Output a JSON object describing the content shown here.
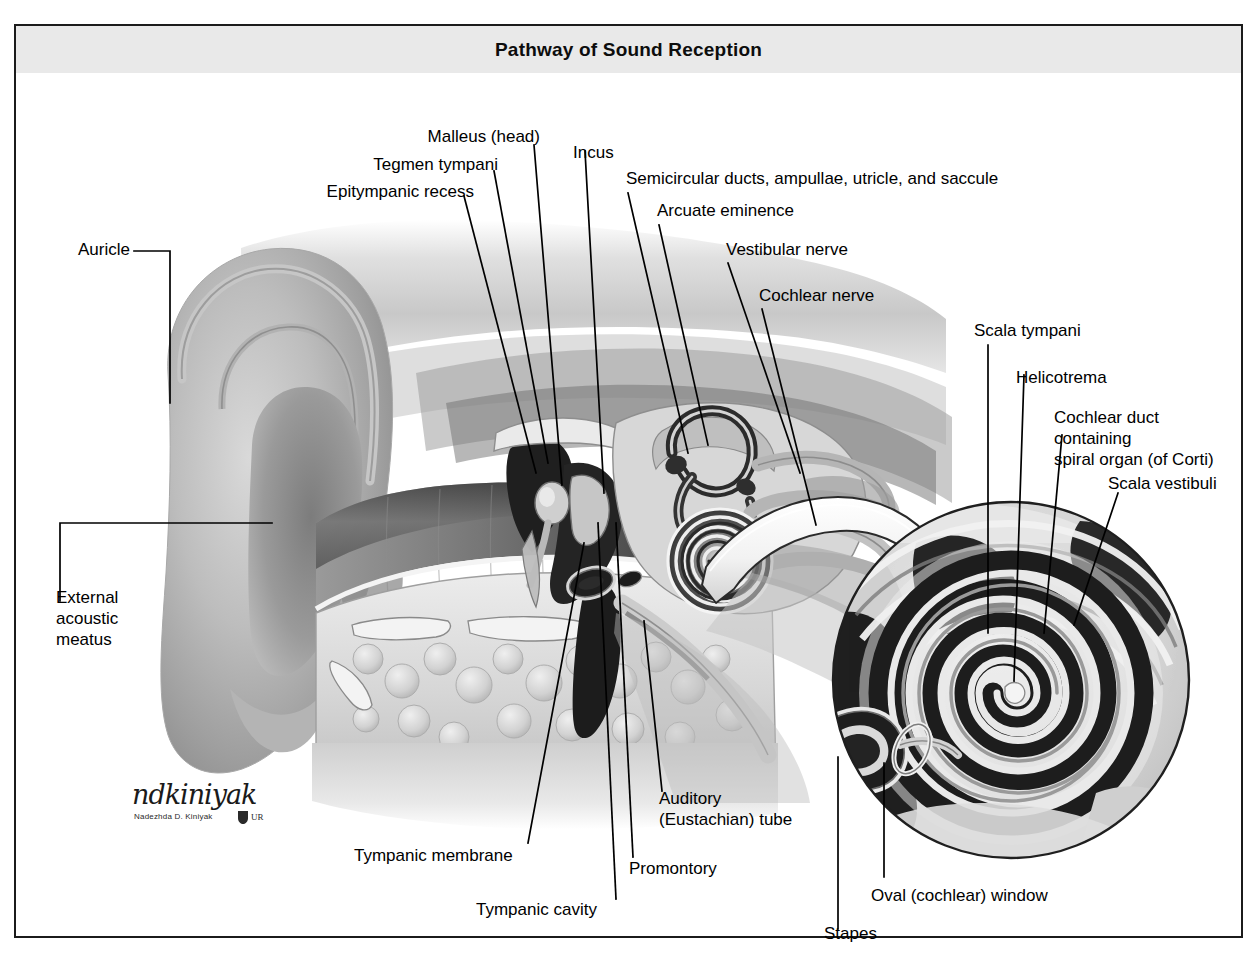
{
  "figure": {
    "title": "Pathway of Sound Reception",
    "header_bg": "#e9e9e9",
    "frame_color": "#1b1b1b",
    "text_color": "#000000",
    "background": "#ffffff"
  },
  "labels": {
    "auricle": "Auricle",
    "external_acoustic_meatus": "External\nacoustic\nmeatus",
    "epitympanic_recess": "Epitympanic recess",
    "tegmen_tympani": "Tegmen tympani",
    "malleus_head": "Malleus (head)",
    "incus": "Incus",
    "semicircular_ducts": "Semicircular ducts, ampullae, utricle, and saccule",
    "arcuate_eminence": "Arcuate eminence",
    "vestibular_nerve": "Vestibular nerve",
    "cochlear_nerve": "Cochlear nerve",
    "scala_tympani": "Scala tympani",
    "helicotrema": "Helicotrema",
    "cochlear_duct": "Cochlear duct containing\nspiral organ (of Corti)",
    "scala_vestibuli": "Scala vestibuli",
    "tympanic_membrane": "Tympanic membrane",
    "tympanic_cavity": "Tympanic cavity",
    "promontory": "Promontory",
    "auditory_tube": "Auditory\n(Eustachian) tube",
    "stapes": "Stapes",
    "oval_window": "Oval (cochlear) window"
  },
  "signature": {
    "script": "ndkiniyak",
    "printed": "Nadezhda D. Kiniyak",
    "mark": "UR"
  },
  "illustration": {
    "subject": "sagittal section of the human ear",
    "inset": "magnified circular view of the cochlea spiral",
    "palette": {
      "dark": "#1d1d1d",
      "mid_dark": "#5a5a5a",
      "mid": "#8d8d8d",
      "light": "#c9c9c9",
      "pale": "#e6e6e6",
      "white": "#ffffff"
    }
  }
}
